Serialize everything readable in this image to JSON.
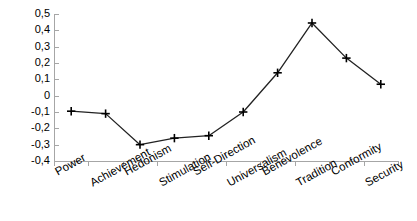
{
  "chart_data": {
    "type": "line",
    "title": "",
    "subtitle": "",
    "xlabel": "",
    "ylabel": "",
    "categories": [
      "Power",
      "Achievement",
      "Hedonism",
      "Stimulation",
      "Self-Direction",
      "Universalism",
      "Benevolence",
      "Tradition",
      "Conformity",
      "Security"
    ],
    "values": [
      -0.095,
      -0.11,
      -0.3,
      -0.26,
      -0.245,
      -0.1,
      0.14,
      0.445,
      0.23,
      0.07
    ],
    "series": [
      {
        "name": "",
        "values": [
          -0.095,
          -0.11,
          -0.3,
          -0.26,
          -0.245,
          -0.1,
          0.14,
          0.445,
          0.23,
          0.07
        ]
      }
    ],
    "ylim": [
      -0.4,
      0.5
    ],
    "ytick_labels": [
      "0,5",
      "0,4",
      "0,3",
      "0,2",
      "0,1",
      "0",
      "-0,1",
      "-0,2",
      "-0,3",
      "-0,4"
    ],
    "ytick_values": [
      0.5,
      0.4,
      0.3,
      0.2,
      0.1,
      0,
      -0.1,
      -0.2,
      -0.3,
      -0.4
    ],
    "grid": false,
    "legend": false,
    "legend_position": "none",
    "marker": "plus",
    "line_color": "#222222",
    "marker_color": "#000000",
    "axis_color": "#a6a6a6",
    "background_color": "#ffffff",
    "annotations": []
  }
}
